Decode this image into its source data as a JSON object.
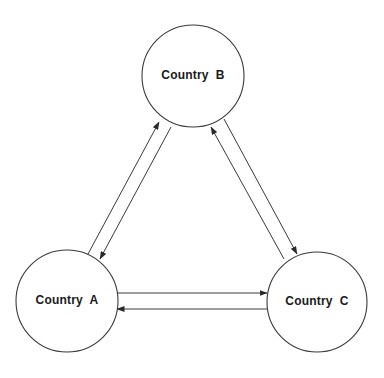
{
  "diagram": {
    "type": "flow-triangle",
    "colors": {
      "stroke": "#3a3a3a",
      "text": "#1a1a1a",
      "background": "#ffffff"
    },
    "nodes": [
      {
        "id": "A",
        "label": "Country  A",
        "cx": 67,
        "cy": 301,
        "r": 51
      },
      {
        "id": "B",
        "label": "Country  B",
        "cx": 193,
        "cy": 76,
        "r": 51
      },
      {
        "id": "C",
        "label": "Country  C",
        "cx": 317,
        "cy": 302,
        "r": 50
      }
    ],
    "edges": [
      {
        "from": "A",
        "to": "B",
        "x1": 88,
        "y1": 254,
        "x2": 159,
        "y2": 122
      },
      {
        "from": "B",
        "to": "A",
        "x1": 171,
        "y1": 127,
        "x2": 100,
        "y2": 259
      },
      {
        "from": "C",
        "to": "B",
        "x1": 284,
        "y1": 259,
        "x2": 211,
        "y2": 127
      },
      {
        "from": "B",
        "to": "C",
        "x1": 224,
        "y1": 119,
        "x2": 297,
        "y2": 254
      },
      {
        "from": "A",
        "to": "C",
        "x1": 117,
        "y1": 293,
        "x2": 267,
        "y2": 293
      },
      {
        "from": "C",
        "to": "A",
        "x1": 267,
        "y1": 309,
        "x2": 117,
        "y2": 309
      }
    ]
  }
}
